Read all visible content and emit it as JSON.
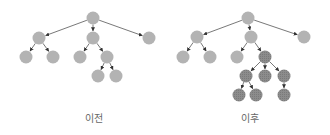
{
  "colors": {
    "node_default": "#b3b3b3",
    "node_highlight": "#8c8c8c",
    "edge": "#555555",
    "caption": "#666666",
    "background": "#ffffff"
  },
  "node_radius": 6.5,
  "panels": [
    {
      "id": "before",
      "caption": "이전",
      "caption_x": 94,
      "nodes": [
        {
          "id": "r",
          "x": 93,
          "y": 18,
          "highlight": false
        },
        {
          "id": "a",
          "x": 39,
          "y": 38,
          "highlight": false
        },
        {
          "id": "b",
          "x": 93,
          "y": 38,
          "highlight": false
        },
        {
          "id": "c",
          "x": 149,
          "y": 38,
          "highlight": false
        },
        {
          "id": "a1",
          "x": 26,
          "y": 57,
          "highlight": false
        },
        {
          "id": "a2",
          "x": 53,
          "y": 57,
          "highlight": false
        },
        {
          "id": "b1",
          "x": 80,
          "y": 57,
          "highlight": false
        },
        {
          "id": "b2",
          "x": 107,
          "y": 57,
          "highlight": false
        },
        {
          "id": "b2a",
          "x": 98,
          "y": 76,
          "highlight": false
        },
        {
          "id": "b2b",
          "x": 116,
          "y": 76,
          "highlight": false
        }
      ],
      "edges": [
        [
          "r",
          "a"
        ],
        [
          "r",
          "b"
        ],
        [
          "r",
          "c"
        ],
        [
          "a",
          "a1"
        ],
        [
          "a",
          "a2"
        ],
        [
          "b",
          "b1"
        ],
        [
          "b",
          "b2"
        ],
        [
          "b2",
          "b2a"
        ],
        [
          "b2",
          "b2b"
        ]
      ]
    },
    {
      "id": "after",
      "caption": "이후",
      "caption_x": 250,
      "nodes": [
        {
          "id": "r",
          "x": 248,
          "y": 18,
          "highlight": false
        },
        {
          "id": "a",
          "x": 197,
          "y": 37,
          "highlight": false
        },
        {
          "id": "b",
          "x": 251,
          "y": 37,
          "highlight": false
        },
        {
          "id": "c",
          "x": 304,
          "y": 37,
          "highlight": false
        },
        {
          "id": "a1",
          "x": 183,
          "y": 57,
          "highlight": false
        },
        {
          "id": "a2",
          "x": 210,
          "y": 57,
          "highlight": false
        },
        {
          "id": "b1",
          "x": 237,
          "y": 57,
          "highlight": false
        },
        {
          "id": "b2",
          "x": 265,
          "y": 57,
          "highlight": true
        },
        {
          "id": "b2a",
          "x": 246,
          "y": 76,
          "highlight": true
        },
        {
          "id": "b2b",
          "x": 265,
          "y": 76,
          "highlight": true
        },
        {
          "id": "b2c",
          "x": 284,
          "y": 76,
          "highlight": true
        },
        {
          "id": "b2a1",
          "x": 239,
          "y": 95,
          "highlight": true
        },
        {
          "id": "b2a2",
          "x": 256,
          "y": 95,
          "highlight": true
        },
        {
          "id": "b2c1",
          "x": 284,
          "y": 95,
          "highlight": true
        }
      ],
      "edges": [
        [
          "r",
          "a"
        ],
        [
          "r",
          "b"
        ],
        [
          "r",
          "c"
        ],
        [
          "a",
          "a1"
        ],
        [
          "a",
          "a2"
        ],
        [
          "b",
          "b1"
        ],
        [
          "b",
          "b2"
        ],
        [
          "b2",
          "b2a"
        ],
        [
          "b2",
          "b2b"
        ],
        [
          "b2",
          "b2c"
        ],
        [
          "b2a",
          "b2a1"
        ],
        [
          "b2a",
          "b2a2"
        ],
        [
          "b2c",
          "b2c1"
        ]
      ]
    }
  ]
}
